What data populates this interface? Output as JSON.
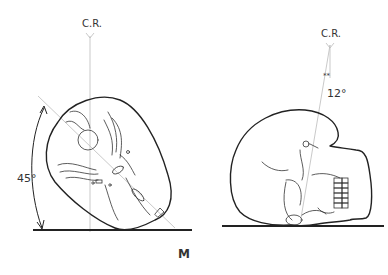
{
  "figure": {
    "left_view": {
      "central_ray_label": "C.R.",
      "angle_label": "45°"
    },
    "right_view": {
      "central_ray_label": "C.R.",
      "angle_label": "12°",
      "marker": "**"
    },
    "caption": "M"
  }
}
